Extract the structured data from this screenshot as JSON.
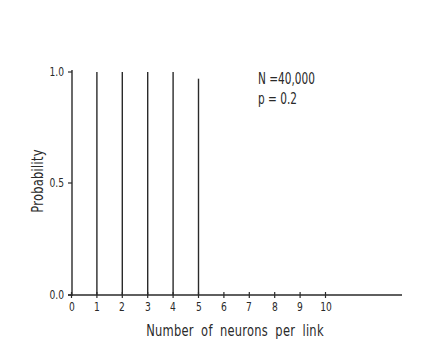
{
  "chart_data": {
    "type": "bar",
    "subtype": "stem",
    "title": "",
    "xlabel": "Number of neurons per link",
    "ylabel": "Probability",
    "categories": [
      "0",
      "1",
      "2",
      "3",
      "4",
      "5",
      "6",
      "7",
      "8",
      "9",
      "10"
    ],
    "x": [
      0,
      1,
      2,
      3,
      4,
      5,
      6,
      7,
      8,
      9,
      10
    ],
    "values": [
      0.0,
      1.0,
      1.0,
      1.0,
      1.0,
      0.97,
      0.0,
      0.0,
      0.0,
      0.0,
      0.0
    ],
    "xlim": [
      0,
      13
    ],
    "ylim": [
      0.0,
      1.0
    ],
    "yticks": [
      "0.0",
      "0.5",
      "1.0"
    ],
    "xticks": [
      "0",
      "1",
      "2",
      "3",
      "4",
      "5",
      "6",
      "7",
      "8",
      "9",
      "10"
    ],
    "grid": false,
    "legend": null,
    "annotations": [
      "N =40,000",
      "p = 0.2"
    ]
  },
  "axes": {
    "ytick_labels": [
      "1.0",
      "0.5",
      "0.0"
    ],
    "xtick_labels": [
      "0",
      "1",
      "2",
      "3",
      "4",
      "5",
      "6",
      "7",
      "8",
      "9",
      "10"
    ]
  },
  "annotation": {
    "n_text": "N =40,000",
    "p_text": "p = 0.2"
  },
  "colors": {
    "ink": "#2a2a2a",
    "background": "#ffffff"
  }
}
